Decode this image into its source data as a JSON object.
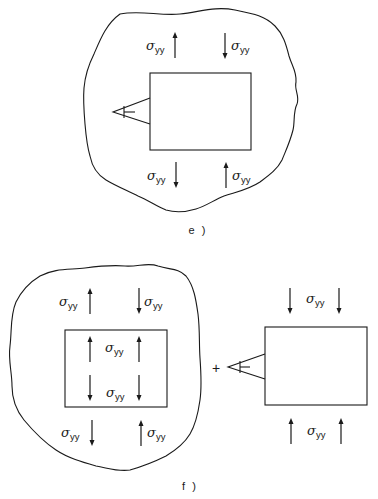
{
  "figure": {
    "panels": [
      {
        "id": "e",
        "caption": "e )",
        "description": "Dislocation with wedge crack inside a solid body under remote stress",
        "labels": {
          "top_left": {
            "symbol": "σ",
            "subscript": "yy"
          },
          "top_right": {
            "symbol": "σ",
            "subscript": "yy"
          },
          "bottom_left": {
            "symbol": "σ",
            "subscript": "yy"
          },
          "bottom_right": {
            "symbol": "σ",
            "subscript": "yy"
          }
        }
      },
      {
        "id": "f",
        "caption": "f )",
        "description": "Superposition: body with cut-out region under stress plus isolated cut-out block with dislocation",
        "operator": "+",
        "labels": {
          "outer_top_left": {
            "symbol": "σ",
            "subscript": "yy"
          },
          "outer_top_right": {
            "symbol": "σ",
            "subscript": "yy"
          },
          "inner_top": {
            "symbol": "σ",
            "subscript": "yy"
          },
          "inner_bottom": {
            "symbol": "σ",
            "subscript": "yy"
          },
          "outer_bottom_left": {
            "symbol": "σ",
            "subscript": "yy"
          },
          "outer_bottom_right": {
            "symbol": "σ",
            "subscript": "yy"
          },
          "block_top": {
            "symbol": "σ",
            "subscript": "yy"
          },
          "block_bottom": {
            "symbol": "σ",
            "subscript": "yy"
          }
        }
      }
    ]
  }
}
